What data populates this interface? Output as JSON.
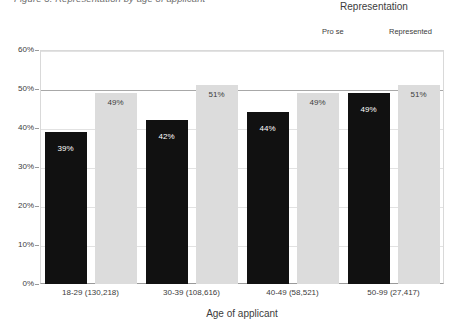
{
  "chart_data": {
    "type": "bar",
    "title": "Figure 3. Representation by age of applicant",
    "xlabel": "Age of applicant",
    "ylabel": "",
    "ylim": [
      0,
      60
    ],
    "yticks": [
      0,
      10,
      20,
      30,
      40,
      50,
      60
    ],
    "ytick_labels": [
      "0%",
      "10%",
      "20%",
      "30%",
      "40%",
      "50%",
      "60%"
    ],
    "grid": true,
    "emphasized_gridline": 50,
    "legend": {
      "title": "Representation",
      "position": "top-right",
      "entries": [
        {
          "name": "Pro se",
          "color": "#111111"
        },
        {
          "name": "Represented",
          "color": "#dcdcdc"
        }
      ]
    },
    "categories": [
      "18-29 (130,218)",
      "30-39 (108,616)",
      "40-49 (58,521)",
      "50-99 (27,417)"
    ],
    "series": [
      {
        "name": "Pro se",
        "color": "#111111",
        "values": [
          39,
          42,
          44,
          49
        ],
        "labels": [
          "39%",
          "42%",
          "44%",
          "49%"
        ]
      },
      {
        "name": "Represented",
        "color": "#dcdcdc",
        "values": [
          49,
          51,
          49,
          51
        ],
        "labels": [
          "49%",
          "51%",
          "49%",
          "51%"
        ]
      }
    ]
  }
}
